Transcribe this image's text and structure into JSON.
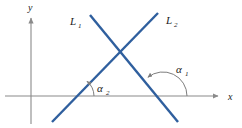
{
  "figure": {
    "background_color": "#ffffff",
    "axis_color": "#8a8a8a",
    "line_color": "#2f5f9e",
    "arc_color": "#7d7d7d",
    "text_color": "#1a1a1a",
    "width": 242,
    "height": 128
  },
  "axes": {
    "x_label": "x",
    "y_label": "y",
    "origin": {
      "x": 31,
      "y": 96
    },
    "x_axis": {
      "x1": 5,
      "y1": 96,
      "x2": 222,
      "y2": 96
    },
    "y_axis": {
      "x1": 31,
      "y1": 122,
      "x2": 31,
      "y2": 14
    }
  },
  "lines": [
    {
      "name": "L1",
      "label": "L",
      "subscript": "1",
      "label_x": 72,
      "label_y": 23,
      "description": "line with negative slope descending left to right",
      "x1": 90,
      "y1": 15,
      "x2": 178,
      "y2": 122,
      "slope_sign": "negative"
    },
    {
      "name": "L2",
      "label": "L",
      "subscript": "2",
      "label_x": 167,
      "label_y": 22,
      "description": "line with positive slope ascending left to right",
      "x1": 52,
      "y1": 122,
      "x2": 158,
      "y2": 13,
      "slope_sign": "positive"
    }
  ],
  "intersection": {
    "x": 123,
    "y": 55
  },
  "angles": [
    {
      "name": "alpha1",
      "label": "α",
      "subscript": "1",
      "label_x": 180,
      "label_y": 71,
      "vertex_x": 163,
      "vertex_y": 96,
      "radius": 24,
      "start_deg": 0,
      "end_deg": 129,
      "measured_from": "positive x-axis",
      "measured_to": "L1",
      "arrow_at": "L1"
    },
    {
      "name": "alpha2",
      "label": "α",
      "subscript": "2",
      "label_x": 101,
      "label_y": 90,
      "vertex_x": 74,
      "vertex_y": 96,
      "radius": 20,
      "start_deg": 0,
      "end_deg": 46,
      "measured_from": "positive x-axis",
      "measured_to": "L2",
      "arrow_at": "L2"
    }
  ]
}
